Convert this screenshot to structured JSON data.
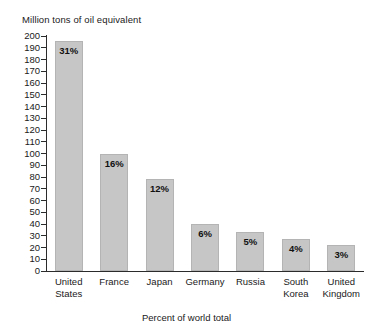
{
  "chart_data": {
    "type": "bar",
    "title": "",
    "ylabel": "Million tons of oil equivalent",
    "xlabel": "Percent of world total",
    "ylim": [
      0,
      200
    ],
    "ytick_step": 10,
    "grid": false,
    "legend": "none",
    "bar_color": "#c6c6c6",
    "categories": [
      "United States",
      "France",
      "Japan",
      "Germany",
      "Russia",
      "South Korea",
      "United Kingdom"
    ],
    "category_lines": [
      [
        "United",
        "States"
      ],
      [
        "France",
        ""
      ],
      [
        "Japan",
        ""
      ],
      [
        "Germany",
        ""
      ],
      [
        "Russia",
        ""
      ],
      [
        "South",
        "Korea"
      ],
      [
        "United",
        "Kingdom"
      ]
    ],
    "values": [
      196,
      100,
      78,
      40,
      33,
      27,
      22
    ],
    "data_labels": [
      "31%",
      "16%",
      "12%",
      "6%",
      "5%",
      "4%",
      "3%"
    ],
    "ytick_labels": [
      "200",
      "190",
      "180",
      "170",
      "160",
      "150",
      "140",
      "130",
      "120",
      "110",
      "100",
      "90",
      "80",
      "70",
      "60",
      "50",
      "40",
      "30",
      "20",
      "10",
      "0"
    ],
    "ytick_values": [
      200,
      190,
      180,
      170,
      160,
      150,
      140,
      130,
      120,
      110,
      100,
      90,
      80,
      70,
      60,
      50,
      40,
      30,
      20,
      10,
      0
    ]
  }
}
